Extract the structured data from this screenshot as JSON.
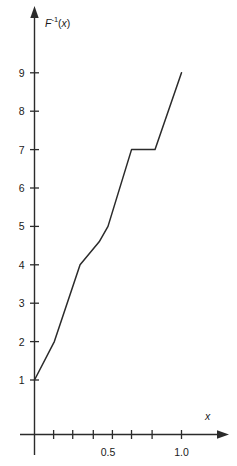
{
  "chart_data": {
    "type": "line",
    "title": "",
    "xlabel": "x",
    "ylabel": "F-1(x)",
    "ylabel_parts": {
      "base": "F",
      "exponent": "-1",
      "arg": "(x)"
    },
    "xlim": [
      0,
      1.2
    ],
    "ylim": [
      0,
      9.6
    ],
    "grid": false,
    "legend": null,
    "x_tick_values": [
      0.13,
      0.26,
      0.4,
      0.53,
      0.66,
      0.8,
      1.0
    ],
    "x_tick_labels": [
      "",
      "",
      "",
      "0.5",
      "",
      "",
      "1.0"
    ],
    "x_labeled_ticks": [
      {
        "value": 0.5,
        "label": "0.5"
      },
      {
        "value": 1.0,
        "label": "1.0"
      }
    ],
    "y_tick_values": [
      1,
      2,
      3,
      4,
      5,
      6,
      7,
      8,
      9
    ],
    "y_tick_labels": [
      "1",
      "2",
      "3",
      "4",
      "5",
      "6",
      "7",
      "8",
      "9"
    ],
    "series": [
      {
        "name": "inverse-cdf",
        "color": "#2b2b2b",
        "points": [
          {
            "x": 0.0,
            "y": 1.0
          },
          {
            "x": 0.135,
            "y": 2.0
          },
          {
            "x": 0.31,
            "y": 4.0
          },
          {
            "x": 0.44,
            "y": 4.6
          },
          {
            "x": 0.5,
            "y": 5.0
          },
          {
            "x": 0.66,
            "y": 7.0
          },
          {
            "x": 0.82,
            "y": 7.0
          },
          {
            "x": 1.0,
            "y": 9.0
          }
        ]
      }
    ],
    "axis_arrows": {
      "x": true,
      "y": true
    },
    "background": "#ffffff"
  }
}
